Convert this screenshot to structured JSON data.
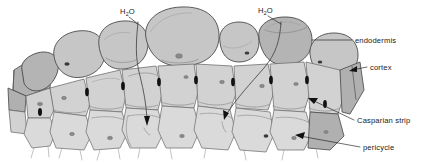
{
  "figure": {
    "background_color": "#ffffff",
    "width": 429,
    "height": 163
  },
  "labels": {
    "water_left": {
      "text": "H",
      "sub": "2",
      "text2": "O",
      "x": 120,
      "y": 13
    },
    "water_right": {
      "text": "H",
      "sub": "2",
      "text2": "O",
      "x": 258,
      "y": 12
    },
    "endodermis": {
      "text": "endodermis",
      "x": 355,
      "y": 42
    },
    "cortex": {
      "text": "cortex",
      "x": 370,
      "y": 69
    },
    "casparian_strip": {
      "text": "Casparian strip",
      "x": 357,
      "y": 122
    },
    "pericycle": {
      "text": "pericycle",
      "x": 363,
      "y": 149
    }
  },
  "colors": {
    "cortex_fill": "#c6c6c6",
    "endodermis_fill": "#d2d2d2",
    "pericycle_fill": "#dadada",
    "cut_face_fill": "#b0b0b0",
    "casparian_strip": "#111111",
    "wall_stroke": "#5d5d5d",
    "label_text": "#1a1a1a",
    "leader_line": "#1d1d1d"
  },
  "tissue_layers": [
    {
      "name": "cortex",
      "position": "outermost",
      "cell_shape": "large rounded",
      "cell_count": 7
    },
    {
      "name": "endodermis",
      "position": "middle",
      "cell_shape": "angular brick",
      "cell_count": 8
    },
    {
      "name": "pericycle",
      "position": "innermost",
      "cell_shape": "polygonal",
      "cell_count": 7
    }
  ],
  "features": {
    "casparian_strip_marks": 7,
    "water_pathway_arrows": 2,
    "root_hairs": 11,
    "nuclei_visible": 12
  }
}
